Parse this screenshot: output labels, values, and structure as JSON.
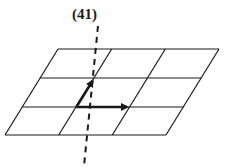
{
  "figure": {
    "label": "(41)",
    "grid": {
      "rows": 3,
      "cols": 3
    },
    "vectors": [
      {
        "name": "oblique-vector",
        "direction": "up-right along cell edge"
      },
      {
        "name": "horizontal-vector",
        "direction": "right along row line"
      }
    ],
    "axis": {
      "style": "dashed",
      "orientation": "near-vertical"
    },
    "colors": {
      "line": "#1a1a1a",
      "background": "#ffffff"
    }
  }
}
